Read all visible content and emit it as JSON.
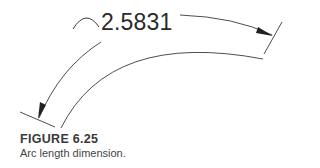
{
  "figure": {
    "label": "FIGURE 6.25",
    "caption": "Arc length dimension."
  },
  "dimension": {
    "value": "2.5831",
    "symbol": "arc-length-symbol"
  },
  "colors": {
    "line": "#3a3a3a",
    "text": "#2a2a2a"
  }
}
